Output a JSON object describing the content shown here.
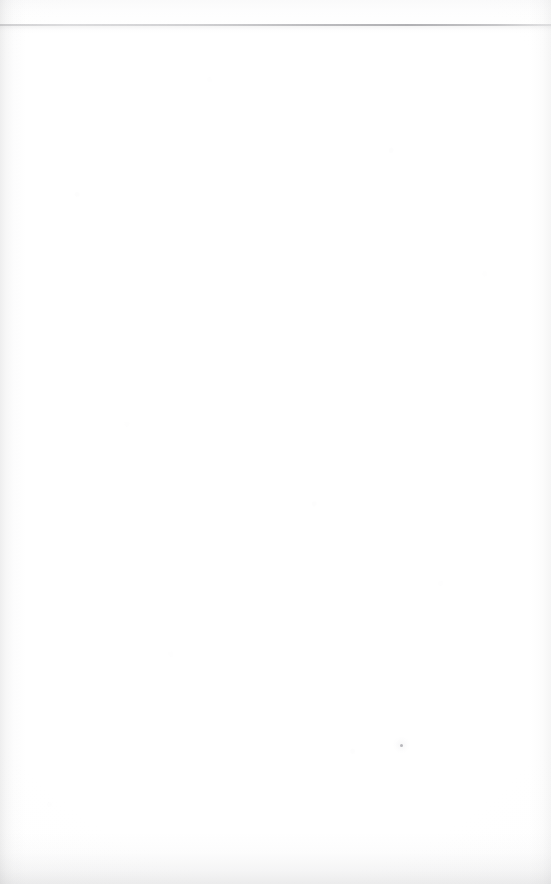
{
  "page": {
    "kind": "scanned-blank-page",
    "width_px": 551,
    "height_px": 884,
    "background_color": "#ffffff",
    "paper_tone_color": "#fcfcfc",
    "visible_text": ""
  },
  "artifacts": {
    "scan_edge_line": {
      "name": "page-edge-rule",
      "orientation": "horizontal",
      "y_px": 24,
      "thickness_px": 2,
      "color": "#74747a",
      "spans_full_width": true
    },
    "ghost_text": {
      "name": "bleed-through-smudge",
      "x_px": 232,
      "y_px": 98,
      "color": "#afafb6",
      "legible": false,
      "content": ""
    },
    "ghost_text_secondary": {
      "name": "bleed-through-smudge-lower",
      "x_px": 246,
      "y_px": 140,
      "color": "#b4b4bc",
      "legible": false,
      "content": ""
    },
    "dust_speck": {
      "name": "dust-speck",
      "x_px": 400,
      "y_px": 744,
      "diameter_px": 3,
      "color": "#78788 0"
    },
    "edge_shading": {
      "left_color": "#96969 8",
      "right_color": "#a0a0a2",
      "bottom_color": "#8c8c8f",
      "top_strip_color": "#cdcdd0"
    }
  }
}
